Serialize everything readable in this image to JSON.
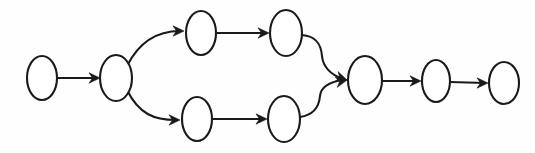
{
  "diagram": {
    "type": "node-link-diagram",
    "style": "hand-drawn",
    "canvas": {
      "width": 535,
      "height": 153
    },
    "colors": {
      "background": "#fefefe",
      "node_fill": "#ffffff",
      "stroke": "#1a1a1a"
    },
    "nodes": [
      {
        "id": "n1",
        "label": "",
        "cx": 42,
        "cy": 78,
        "rx": 15,
        "ry": 22,
        "role": "start"
      },
      {
        "id": "n2",
        "label": "",
        "cx": 116,
        "cy": 78,
        "rx": 16,
        "ry": 23,
        "role": "fork"
      },
      {
        "id": "n3",
        "label": "",
        "cx": 201,
        "cy": 33,
        "rx": 15,
        "ry": 22,
        "role": "branch-upper-first"
      },
      {
        "id": "n4",
        "label": "",
        "cx": 286,
        "cy": 33,
        "rx": 16,
        "ry": 23,
        "role": "branch-upper-second"
      },
      {
        "id": "n5",
        "label": "",
        "cx": 197,
        "cy": 119,
        "rx": 15,
        "ry": 22,
        "role": "branch-lower-first"
      },
      {
        "id": "n6",
        "label": "",
        "cx": 284,
        "cy": 119,
        "rx": 16,
        "ry": 23,
        "role": "branch-lower-second"
      },
      {
        "id": "n7",
        "label": "",
        "cx": 365,
        "cy": 80,
        "rx": 17,
        "ry": 24,
        "role": "merge"
      },
      {
        "id": "n8",
        "label": "",
        "cx": 436,
        "cy": 81,
        "rx": 14,
        "ry": 21,
        "role": "middle"
      },
      {
        "id": "n9",
        "label": "",
        "cx": 504,
        "cy": 83,
        "rx": 15,
        "ry": 21,
        "role": "end"
      }
    ],
    "edges": [
      {
        "id": "e1",
        "from": "n1",
        "to": "n2",
        "label": "",
        "shape": "straight",
        "d": "M 58 78 L 97 78",
        "arrow": {
          "x": 100,
          "y": 78,
          "angle": 0
        }
      },
      {
        "id": "e2",
        "from": "n2",
        "to": "n3",
        "label": "",
        "shape": "curve-up",
        "d": "M 127 66 C 139 42, 156 31, 180 31",
        "arrow": {
          "x": 184,
          "y": 31,
          "angle": 0
        }
      },
      {
        "id": "e3",
        "from": "n2",
        "to": "n5",
        "label": "",
        "shape": "curve-down",
        "d": "M 127 90 C 139 114, 154 120, 176 120",
        "arrow": {
          "x": 180,
          "y": 120,
          "angle": 0
        }
      },
      {
        "id": "e4",
        "from": "n3",
        "to": "n4",
        "label": "",
        "shape": "straight",
        "d": "M 217 33 L 266 33",
        "arrow": {
          "x": 269,
          "y": 33,
          "angle": 0
        }
      },
      {
        "id": "e5",
        "from": "n5",
        "to": "n6",
        "label": "",
        "shape": "straight",
        "d": "M 213 119 L 264 119",
        "arrow": {
          "x": 267,
          "y": 119,
          "angle": 0
        }
      },
      {
        "id": "e6",
        "from": "n4",
        "to": "n7",
        "label": "",
        "shape": "curve-down-right",
        "d": "M 302 35 C 316 36, 321 44, 322 56 C 323 66, 329 74, 343 79",
        "arrow": {
          "x": 347,
          "y": 80,
          "angle": 18
        }
      },
      {
        "id": "e7",
        "from": "n6",
        "to": "n7",
        "label": "",
        "shape": "curve-up-right",
        "d": "M 300 117 C 314 115, 319 107, 320 96 C 321 87, 328 82, 343 80",
        "arrow": {
          "x": 347,
          "y": 80,
          "angle": -12
        }
      },
      {
        "id": "e8",
        "from": "n7",
        "to": "n8",
        "label": "",
        "shape": "straight",
        "d": "M 382 81 L 417 81",
        "arrow": {
          "x": 421,
          "y": 81,
          "angle": 0
        }
      },
      {
        "id": "e9",
        "from": "n8",
        "to": "n9",
        "label": "",
        "shape": "straight",
        "d": "M 450 82 L 485 83",
        "arrow": {
          "x": 488,
          "y": 83,
          "angle": 0
        }
      }
    ]
  }
}
